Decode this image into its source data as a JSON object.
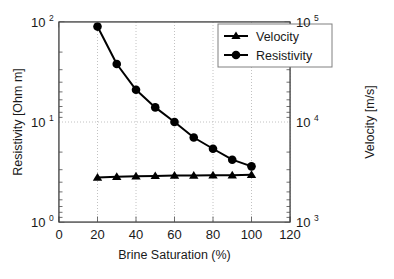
{
  "chart_data": {
    "type": "line",
    "title": "",
    "xlabel": "Brine Saturation (%)",
    "ylabel": "Resistivity [Ohm m]",
    "y2label": "Velocity [m/s]",
    "xlim": [
      0,
      120
    ],
    "xticks": [
      "0",
      "20",
      "40",
      "60",
      "80",
      "100",
      "120"
    ],
    "xtick_values": [
      0,
      20,
      40,
      60,
      80,
      100,
      120
    ],
    "yscale": "log",
    "ylim": [
      1,
      100
    ],
    "yticks": [
      "10",
      "10",
      "10"
    ],
    "ytick_values": [
      100,
      10,
      1
    ],
    "ytick_exponents": [
      "2",
      "1",
      "0"
    ],
    "y2scale": "log",
    "y2lim": [
      1000,
      100000
    ],
    "y2ticks": [
      "10",
      "10",
      "10"
    ],
    "y2tick_values": [
      100000,
      10000,
      1000
    ],
    "y2tick_exponents": [
      "5",
      "4",
      "3"
    ],
    "grid": "dotted",
    "legend_position": "top-right",
    "x": [
      20,
      30,
      40,
      50,
      60,
      70,
      80,
      90,
      100
    ],
    "series": [
      {
        "name": "Velocity",
        "axis": "right",
        "marker": "triangle",
        "color": "#000000",
        "values": [
          2780,
          2830,
          2870,
          2890,
          2910,
          2920,
          2930,
          2930,
          2960
        ]
      },
      {
        "name": "Resistivity",
        "axis": "left",
        "marker": "circle",
        "color": "#000000",
        "values": [
          90,
          38,
          21,
          14,
          10,
          7.0,
          5.4,
          4.2,
          3.6
        ]
      }
    ],
    "legend_entries": [
      {
        "label": "Velocity",
        "marker": "triangle"
      },
      {
        "label": "Resistivity",
        "marker": "circle"
      }
    ]
  },
  "axis": {
    "left_title": "Resistivity [Ohm m]",
    "right_title": "Velocity [m/s]",
    "bottom_title": "Brine Saturation (%)"
  },
  "legend": {
    "velocity_label": "Velocity",
    "resistivity_label": "Resistivity"
  },
  "ticks": {
    "x": [
      "0",
      "20",
      "40",
      "60",
      "80",
      "100",
      "120"
    ],
    "y_left_base": "10",
    "y_left_exps": [
      "2",
      "1",
      "0"
    ],
    "y_right_base": "10",
    "y_right_exps": [
      "5",
      "4",
      "3"
    ]
  },
  "colors": {
    "line": "#000000",
    "axis": "#4d4d4d",
    "grid": "#b3b3b3",
    "background": "#ffffff"
  }
}
